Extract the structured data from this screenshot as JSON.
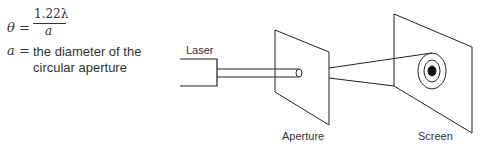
{
  "formula": {
    "lhs": "θ =",
    "numerator": "1.22λ",
    "denominator": "a",
    "def_var": "a =",
    "def_text_line1": "the diameter of the",
    "def_text_line2": "circular aperture"
  },
  "diagram": {
    "labels": {
      "laser": "Laser",
      "aperture": "Aperture",
      "screen": "Screen"
    },
    "line_color": "#222222"
  }
}
